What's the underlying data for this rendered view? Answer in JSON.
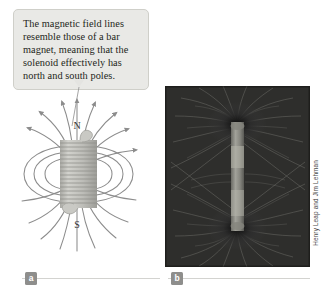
{
  "figure": {
    "callout": {
      "text": "The magnetic field lines resemble those of a bar magnet, meaning that the solenoid effectively has north and south poles.",
      "background_color": "#e9e9e6",
      "border_color": "#cfcfc9"
    },
    "panel_a": {
      "badge_label": "a",
      "type": "solenoid-field-line-diagram",
      "pole_labels": {
        "north": "N",
        "south": "S"
      },
      "field_line_color": "#8c8c8c",
      "coil_color": "#b5b5b0"
    },
    "panel_b": {
      "badge_label": "b",
      "type": "iron-filings-photograph",
      "credit": "Henry Leap and Jim Lehman",
      "background_color": "#1a1a1a"
    }
  }
}
